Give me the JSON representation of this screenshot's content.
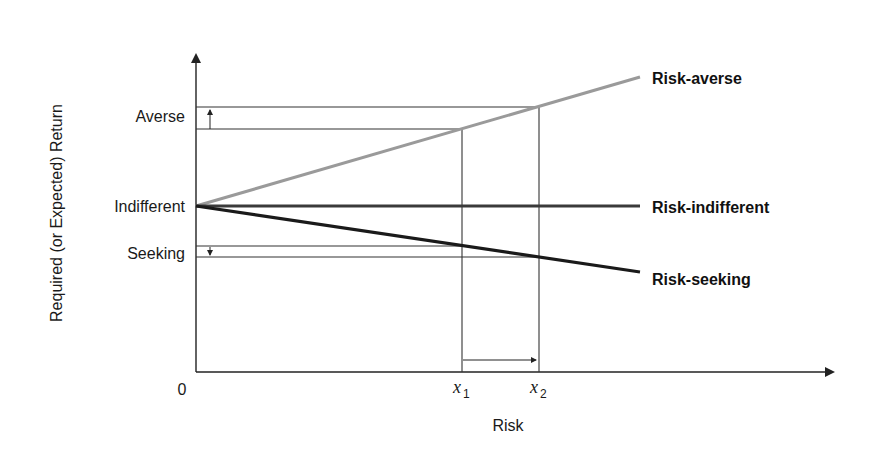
{
  "axes": {
    "y_label": "Required (or Expected) Return",
    "x_label": "Risk",
    "origin_label": "0"
  },
  "y_ticks": {
    "averse": "Averse",
    "indifferent": "Indifferent",
    "seeking": "Seeking"
  },
  "x_ticks": {
    "x1": {
      "var": "x",
      "sub": "1"
    },
    "x2": {
      "var": "x",
      "sub": "2"
    }
  },
  "lines": [
    {
      "id": "risk-averse",
      "label": "Risk-averse",
      "color": "#9a9a9a"
    },
    {
      "id": "risk-indifferent",
      "label": "Risk-indifferent",
      "color": "#3a3a3a"
    },
    {
      "id": "risk-seeking",
      "label": "Risk-seeking",
      "color": "#1a1a1a"
    }
  ],
  "colors": {
    "axis": "#222222",
    "guide": "#333333",
    "averse_line": "#9a9a9a",
    "indifferent_line": "#3a3a3a",
    "seeking_line": "#1a1a1a"
  }
}
